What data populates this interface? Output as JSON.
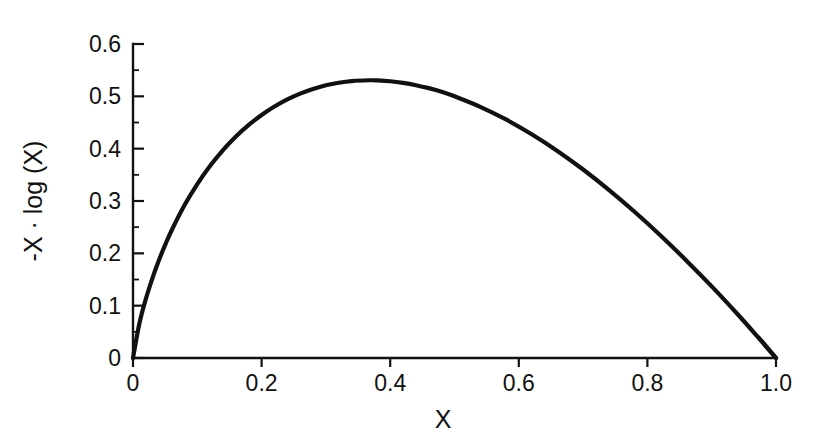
{
  "figure": {
    "background_color": "#ffffff",
    "foreground_color": "#111111",
    "width": 830,
    "height": 436
  },
  "chart_data": {
    "type": "line",
    "title": "",
    "subtitle": "",
    "xlabel": "X",
    "ylabel": "-X · log (X)",
    "xlim": [
      0,
      1.0
    ],
    "ylim": [
      0,
      0.6
    ],
    "grid": false,
    "legend": null,
    "legend_position": "none",
    "xticks": [
      0,
      0.2,
      0.4,
      0.6,
      0.8,
      1.0
    ],
    "xticklabels": [
      "0",
      "0.2",
      "0.4",
      "0.6",
      "0.8",
      "1.0"
    ],
    "yticks": [
      0,
      0.1,
      0.2,
      0.3,
      0.4,
      0.5,
      0.6
    ],
    "yticklabels": [
      "0",
      "0.1",
      "0.2",
      "0.3",
      "0.4",
      "0.5",
      "0.6"
    ],
    "y_minor_ticks": [
      0.05,
      0.15,
      0.25,
      0.35,
      0.45,
      0.55
    ],
    "annotations": [],
    "series": [
      {
        "name": "-X · log (X)",
        "color": "#111111",
        "linewidth": 4.2,
        "x": [
          0,
          0.01,
          0.02,
          0.03,
          0.04,
          0.05,
          0.06,
          0.08,
          0.1,
          0.12,
          0.14,
          0.16,
          0.18,
          0.2,
          0.22,
          0.24,
          0.26,
          0.28,
          0.3,
          0.32,
          0.34,
          0.3679,
          0.38,
          0.4,
          0.42,
          0.44,
          0.46,
          0.48,
          0.5,
          0.54,
          0.58,
          0.62,
          0.66,
          0.7,
          0.74,
          0.78,
          0.82,
          0.86,
          0.9,
          0.94,
          0.97,
          1.0
        ],
        "y": [
          0,
          0.0664,
          0.1129,
          0.1518,
          0.1858,
          0.2161,
          0.2436,
          0.2917,
          0.3322,
          0.3672,
          0.3972,
          0.4232,
          0.4454,
          0.4644,
          0.4805,
          0.4941,
          0.5052,
          0.5141,
          0.5211,
          0.526,
          0.5292,
          0.5307,
          0.5305,
          0.5288,
          0.5257,
          0.5213,
          0.5157,
          0.5088,
          0.5,
          0.48,
          0.4558,
          0.4276,
          0.3957,
          0.3602,
          0.3214,
          0.2795,
          0.2347,
          0.187,
          0.1368,
          0.084,
          0.0426,
          0
        ]
      }
    ],
    "maximum": {
      "x": 0.3679,
      "y": 0.5307
    }
  },
  "axes": {
    "x_axis_label": "X",
    "y_axis_label": "-X · log (X)"
  }
}
